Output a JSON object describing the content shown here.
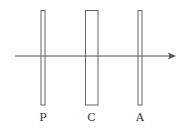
{
  "diagram": {
    "colors": {
      "stroke": "#555555",
      "ray": "#555555",
      "label": "#333333",
      "background": "#ffffff"
    },
    "ray": {
      "direction": "left-to-right",
      "arrowhead": true
    },
    "elements": [
      {
        "id": "polarizer",
        "label": "P",
        "shape": "thin-plate"
      },
      {
        "id": "cell",
        "label": "C",
        "shape": "wide-plate"
      },
      {
        "id": "analyzer",
        "label": "A",
        "shape": "thin-plate"
      }
    ]
  }
}
